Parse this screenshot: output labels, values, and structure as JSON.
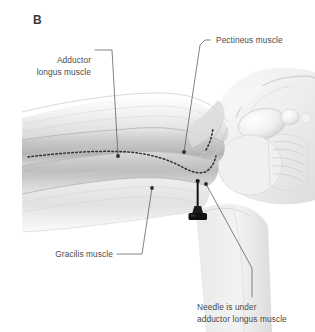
{
  "figure": {
    "panel_letter": "B",
    "background_color": "#ffffff",
    "text_color": "#4a4a4a",
    "leader_color": "#55585c",
    "needle_color": "#1a1a1a"
  },
  "labels": {
    "adductor_longus_line1": "Adductor",
    "adductor_longus_line2": "longus muscle",
    "pectineus": "Pectineus muscle",
    "gracilis": "Gracilis muscle",
    "needle_line1": "Needle is under",
    "needle_line2": "adductor longus muscle"
  },
  "illustration_parts": {
    "thigh": "thigh-musculature",
    "pelvis": "pelvis-and-groin",
    "needle": "injection-needle",
    "dotted_line": "adductor-longus-border-dotted-outline"
  }
}
